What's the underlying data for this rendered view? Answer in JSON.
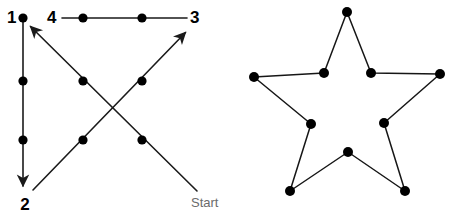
{
  "figure": {
    "background_color": "#ffffff",
    "line_color": "#1a1a1a",
    "dot_color": "#000000",
    "label_color": "#000000",
    "start_label_color": "#6b6b6b"
  },
  "left_diagram": {
    "name": "numbered-stroke-path",
    "labels": {
      "one": "1",
      "two": "2",
      "three": "3",
      "four": "4",
      "start": "Start"
    },
    "label_positions": {
      "one": {
        "x": 7,
        "y": 19
      },
      "two": {
        "x": 19,
        "y": 206
      },
      "three": {
        "x": 189,
        "y": 19
      },
      "four": {
        "x": 47,
        "y": 19
      },
      "start": {
        "x": 191,
        "y": 204
      }
    },
    "dots": [
      {
        "id": "dot-top-left",
        "x": 23,
        "y": 18,
        "r": 4.5
      },
      {
        "id": "dot-left-upper-mid",
        "x": 23,
        "y": 81,
        "r": 4.5
      },
      {
        "id": "dot-left-lower-mid",
        "x": 23,
        "y": 140,
        "r": 4.5
      },
      {
        "id": "dot-top-mid-left",
        "x": 83,
        "y": 18,
        "r": 4.5
      },
      {
        "id": "dot-top-mid-right",
        "x": 142,
        "y": 18,
        "r": 4.5
      },
      {
        "id": "dot-center-upper-left",
        "x": 83,
        "y": 81,
        "r": 4.5
      },
      {
        "id": "dot-center-upper-right",
        "x": 142,
        "y": 81,
        "r": 4.5
      },
      {
        "id": "dot-center-lower-left",
        "x": 83,
        "y": 140,
        "r": 4.5
      },
      {
        "id": "dot-center-lower-right",
        "x": 142,
        "y": 140,
        "r": 4.5
      }
    ],
    "strokes": [
      {
        "id": "stroke-start-to-3",
        "from": {
          "x": 197,
          "y": 191
        },
        "to": {
          "x": 189,
          "y": 29
        },
        "arrow": true,
        "note": "Start up-left then up-right to 3"
      },
      {
        "id": "stroke-1-down-to-2",
        "from": {
          "x": 23,
          "y": 18
        },
        "to": {
          "x": 23,
          "y": 190
        },
        "arrow": true
      },
      {
        "id": "stroke-2-to-1-diagonal",
        "from": {
          "x": 33,
          "y": 190
        },
        "to": {
          "x": 27,
          "y": 23
        },
        "arrow": true
      },
      {
        "id": "stroke-4-to-3-horizontal",
        "from": {
          "x": 63,
          "y": 18
        },
        "to": {
          "x": 186,
          "y": 18
        },
        "arrow": false
      }
    ],
    "segments_description": [
      "Start at lower right, travel up-left diagonally through two dots to arrowhead at 1",
      "From 1 straight down through two dots to arrowhead at 2",
      "From 2 up-right diagonally through two dots to arrowhead at 3",
      "Horizontal line from 4 through two dots to 3"
    ]
  },
  "right_diagram": {
    "name": "star-outline",
    "stroke_color": "#161616",
    "dot_radius": 5,
    "vertices": [
      {
        "id": "star-point-top",
        "x": 347,
        "y": 12,
        "type": "outer"
      },
      {
        "id": "star-inner-upper-right",
        "x": 371,
        "y": 73,
        "type": "inner"
      },
      {
        "id": "star-point-right",
        "x": 440,
        "y": 74,
        "type": "outer"
      },
      {
        "id": "star-inner-lower-right",
        "x": 384,
        "y": 123,
        "type": "inner"
      },
      {
        "id": "star-point-bottom-right",
        "x": 405,
        "y": 191,
        "type": "outer"
      },
      {
        "id": "star-inner-bottom",
        "x": 348,
        "y": 152,
        "type": "inner"
      },
      {
        "id": "star-point-bottom-left",
        "x": 290,
        "y": 191,
        "type": "outer"
      },
      {
        "id": "star-inner-lower-left",
        "x": 311,
        "y": 124,
        "type": "inner"
      },
      {
        "id": "star-point-left",
        "x": 254,
        "y": 77,
        "type": "outer"
      },
      {
        "id": "star-inner-upper-left",
        "x": 324,
        "y": 73,
        "type": "inner"
      }
    ],
    "closed": true
  }
}
